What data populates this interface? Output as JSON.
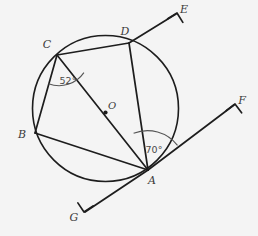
{
  "figure": {
    "kind": "circle-geometry-diagram",
    "background_color": "#f4f4f4",
    "stroke_color": "#1d1d1d",
    "label_color": "#3a3a3a",
    "width": 258,
    "height": 236
  },
  "circle": {
    "center_label": "O",
    "center_x": 105.5,
    "center_y": 108.5,
    "radius": 73
  },
  "points": {
    "A": {
      "label": "A",
      "x": 148,
      "y": 170,
      "label_x": 152,
      "label_y": 183
    },
    "B": {
      "label": "B",
      "x": 35,
      "y": 133,
      "label_x": 22,
      "label_y": 137
    },
    "C": {
      "label": "C",
      "x": 57,
      "y": 55,
      "label_x": 47,
      "label_y": 48
    },
    "D": {
      "label": "D",
      "x": 129,
      "y": 43,
      "label_x": 124,
      "label_y": 35
    },
    "E": {
      "label": "E",
      "x": 176,
      "y": 14,
      "label_x": 183,
      "label_y": 11
    },
    "F": {
      "label": "F",
      "x": 234,
      "y": 105,
      "label_x": 241,
      "label_y": 103
    },
    "G": {
      "label": "G",
      "x": 85,
      "y": 212,
      "label_x": 75,
      "label_y": 219
    }
  },
  "segments": [
    {
      "name": "chord-C-D",
      "from": "C",
      "to": "D"
    },
    {
      "name": "chord-B-C",
      "from": "C",
      "to": "B"
    },
    {
      "name": "chord-B-A",
      "from": "B",
      "to": "A"
    },
    {
      "name": "chord-D-A",
      "from": "D",
      "to": "A"
    },
    {
      "name": "diameter-C-A",
      "from": "C",
      "to": "A"
    }
  ],
  "rays": [
    {
      "name": "ray-D-E",
      "from": "D",
      "to": "E",
      "arrow": true
    },
    {
      "name": "ray-A-F",
      "from": "A",
      "to": "F",
      "arrow": true
    },
    {
      "name": "ray-A-G",
      "from": "A",
      "to": "G",
      "arrow": true
    }
  ],
  "angles": [
    {
      "name": "angle-at-C",
      "vertex": "C",
      "value": "52°",
      "label_x": 68,
      "label_y": 82,
      "arc_radius": 30,
      "start_deg": 56,
      "end_deg": 108
    },
    {
      "name": "angle-at-A",
      "vertex": "A",
      "value": "70°",
      "label_x": 153,
      "label_y": 149,
      "arc_radius": 38,
      "start_deg": -40,
      "end_deg": -110
    }
  ],
  "labels": {
    "A": "A",
    "B": "B",
    "C": "C",
    "D": "D",
    "E": "E",
    "F": "F",
    "G": "G",
    "O": "O",
    "angle_C": "52°",
    "angle_A": "70°"
  }
}
